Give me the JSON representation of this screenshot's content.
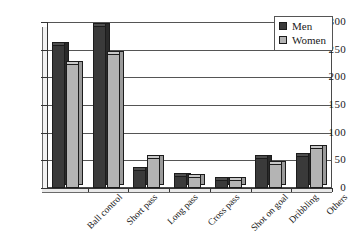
{
  "chart_data": {
    "type": "bar",
    "title": "",
    "subtitle": "",
    "xlabel": "",
    "ylabel": "",
    "ylim": [
      0,
      300
    ],
    "yticks": [
      0,
      50,
      100,
      150,
      200,
      250,
      300
    ],
    "grid": "horizontal",
    "legend_position": "top-right",
    "style": "3d-grouped-bar",
    "categories": [
      "Ball control",
      "Short pass",
      "Long pass",
      "Cross pass",
      "Shot on goal",
      "Dribbling",
      "Others"
    ],
    "series": [
      {
        "name": "Men",
        "color": "#3a3a3a",
        "values": [
          258,
          293,
          33,
          22,
          14,
          55,
          57
        ]
      },
      {
        "name": "Women",
        "color": "#b4b4b4",
        "values": [
          225,
          243,
          55,
          20,
          14,
          43,
          72
        ]
      }
    ]
  },
  "legend": {
    "entries": [
      {
        "label": "Men",
        "color": "#3a3a3a"
      },
      {
        "label": "Women",
        "color": "#b4b4b4"
      }
    ]
  },
  "axis": {
    "y_tick_labels": [
      "300",
      "250",
      "200",
      "150",
      "100",
      "50",
      "0"
    ]
  }
}
